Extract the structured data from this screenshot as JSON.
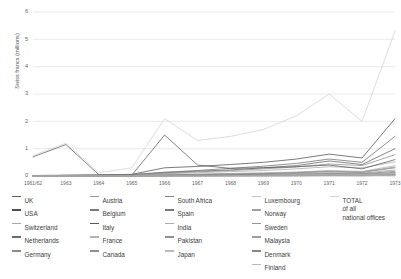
{
  "chart_data": {
    "type": "line",
    "title": "",
    "xlabel": "",
    "ylabel": "Swiss francs (millions)",
    "ylim": [
      0,
      6
    ],
    "yticks": [
      0,
      1,
      2,
      3,
      4,
      5,
      6
    ],
    "grid": true,
    "legend_position": "bottom",
    "categories": [
      "1961/62",
      "1963",
      "1964",
      "1965",
      "1966",
      "1967",
      "1968",
      "1969",
      "1970",
      "1971",
      "1972",
      "1973"
    ],
    "series": [
      {
        "name": "UK",
        "color": "#5d5d5d",
        "values": [
          0.7,
          1.15,
          0.05,
          0.05,
          0.12,
          0.18,
          0.22,
          0.3,
          0.38,
          0.55,
          0.42,
          1.0
        ]
      },
      {
        "name": "USA",
        "color": "#4f4f4f",
        "values": [
          0.02,
          0.03,
          0.04,
          0.06,
          0.3,
          0.35,
          0.42,
          0.5,
          0.62,
          0.8,
          0.66,
          2.1
        ]
      },
      {
        "name": "Switzerland",
        "color": "#a8a8a8",
        "values": [
          0.01,
          0.02,
          0.03,
          0.04,
          0.08,
          0.12,
          0.16,
          0.2,
          0.26,
          0.34,
          0.3,
          0.52
        ]
      },
      {
        "name": "Netherlands",
        "color": "#6b6b6b",
        "values": [
          0.01,
          0.02,
          0.03,
          0.05,
          0.14,
          0.2,
          0.28,
          0.36,
          0.46,
          0.62,
          0.5,
          1.45
        ]
      },
      {
        "name": "Germany",
        "color": "#8c8c8c",
        "values": [
          0.01,
          0.02,
          0.03,
          0.04,
          0.1,
          0.15,
          0.2,
          0.26,
          0.33,
          0.44,
          0.38,
          0.78
        ]
      },
      {
        "name": "Austria",
        "color": "#9a9a9a",
        "values": [
          0.0,
          0.01,
          0.01,
          0.02,
          0.03,
          0.04,
          0.05,
          0.07,
          0.09,
          0.12,
          0.1,
          0.22
        ]
      },
      {
        "name": "Belgium",
        "color": "#7a7a7a",
        "values": [
          0.0,
          0.01,
          0.01,
          0.02,
          0.04,
          0.05,
          0.07,
          0.09,
          0.12,
          0.16,
          0.13,
          0.3
        ]
      },
      {
        "name": "Italy",
        "color": "#585858",
        "values": [
          0.01,
          0.02,
          0.02,
          0.03,
          1.5,
          0.4,
          0.28,
          0.3,
          0.34,
          0.4,
          0.26,
          0.6
        ]
      },
      {
        "name": "France",
        "color": "#b4b4b4",
        "values": [
          0.0,
          0.01,
          0.01,
          0.02,
          0.05,
          0.07,
          0.09,
          0.12,
          0.15,
          0.2,
          0.17,
          0.38
        ]
      },
      {
        "name": "Canada",
        "color": "#8f8f8f",
        "values": [
          0.0,
          0.01,
          0.01,
          0.02,
          0.04,
          0.06,
          0.08,
          0.1,
          0.13,
          0.18,
          0.15,
          0.33
        ]
      },
      {
        "name": "South Africa",
        "color": "#838383",
        "values": [
          0.0,
          0.0,
          0.01,
          0.01,
          0.02,
          0.03,
          0.04,
          0.05,
          0.07,
          0.09,
          0.08,
          0.17
        ]
      },
      {
        "name": "Spain",
        "color": "#777777",
        "values": [
          0.0,
          0.0,
          0.01,
          0.01,
          0.02,
          0.02,
          0.03,
          0.04,
          0.05,
          0.07,
          0.06,
          0.13
        ]
      },
      {
        "name": "India",
        "color": "#aeaeae",
        "values": [
          0.0,
          0.0,
          0.01,
          0.01,
          0.01,
          0.02,
          0.02,
          0.03,
          0.04,
          0.05,
          0.05,
          0.1
        ]
      },
      {
        "name": "Pakistan",
        "color": "#909090",
        "values": [
          0.0,
          0.0,
          0.0,
          0.01,
          0.01,
          0.01,
          0.02,
          0.02,
          0.03,
          0.04,
          0.04,
          0.08
        ]
      },
      {
        "name": "Japan",
        "color": "#bcbcbc",
        "values": [
          0.0,
          0.0,
          0.0,
          0.01,
          0.01,
          0.01,
          0.02,
          0.02,
          0.03,
          0.04,
          0.03,
          0.07
        ]
      },
      {
        "name": "Luxembourg",
        "color": "#c2c2c2",
        "values": [
          0.0,
          0.0,
          0.0,
          0.0,
          0.01,
          0.01,
          0.01,
          0.02,
          0.02,
          0.03,
          0.03,
          0.06
        ]
      },
      {
        "name": "Norway",
        "color": "#a0a0a0",
        "values": [
          0.0,
          0.0,
          0.0,
          0.0,
          0.01,
          0.01,
          0.01,
          0.02,
          0.02,
          0.03,
          0.02,
          0.05
        ]
      },
      {
        "name": "Sweden",
        "color": "#949494",
        "values": [
          0.0,
          0.0,
          0.0,
          0.0,
          0.01,
          0.01,
          0.01,
          0.01,
          0.02,
          0.02,
          0.02,
          0.05
        ]
      },
      {
        "name": "Malaysia",
        "color": "#9e9e9e",
        "values": [
          0.0,
          0.0,
          0.0,
          0.0,
          0.0,
          0.01,
          0.01,
          0.01,
          0.01,
          0.02,
          0.02,
          0.04
        ]
      },
      {
        "name": "Denmark",
        "color": "#888888",
        "values": [
          0.0,
          0.0,
          0.0,
          0.0,
          0.0,
          0.01,
          0.01,
          0.01,
          0.01,
          0.02,
          0.01,
          0.03
        ]
      },
      {
        "name": "Finland",
        "color": "#b8b8b8",
        "values": [
          0.0,
          0.0,
          0.0,
          0.0,
          0.0,
          0.0,
          0.01,
          0.01,
          0.01,
          0.01,
          0.01,
          0.03
        ]
      },
      {
        "name": "TOTAL of all national offices",
        "color": "#d2d2d2",
        "values": [
          0.75,
          1.2,
          0.12,
          0.3,
          2.1,
          1.3,
          1.45,
          1.7,
          2.2,
          3.0,
          2.0,
          5.3
        ]
      }
    ]
  },
  "legend": {
    "columns": [
      {
        "items": [
          {
            "label": "UK",
            "color": "#5d5d5d"
          },
          {
            "label": "USA",
            "color": "#4f4f4f"
          },
          {
            "label": "Switzerland",
            "color": "#a8a8a8"
          },
          {
            "label": "Netherlands",
            "color": "#6b6b6b"
          },
          {
            "label": "Germany",
            "color": "#8c8c8c"
          }
        ]
      },
      {
        "items": [
          {
            "label": "Austria",
            "color": "#9a9a9a"
          },
          {
            "label": "Belgium",
            "color": "#7a7a7a"
          },
          {
            "label": "Italy",
            "color": "#585858"
          },
          {
            "label": "France",
            "color": "#b4b4b4"
          },
          {
            "label": "Canada",
            "color": "#8f8f8f"
          }
        ]
      },
      {
        "items": [
          {
            "label": "South Africa",
            "color": "#838383"
          },
          {
            "label": "Spain",
            "color": "#777777"
          },
          {
            "label": "India",
            "color": "#aeaeae"
          },
          {
            "label": "Pakistan",
            "color": "#909090"
          },
          {
            "label": "Japan",
            "color": "#bcbcbc"
          }
        ]
      },
      {
        "items": [
          {
            "label": "Luxembourg",
            "color": "#c2c2c2"
          },
          {
            "label": "Norway",
            "color": "#a0a0a0"
          },
          {
            "label": "Sweden",
            "color": "#949494"
          },
          {
            "label": "Malaysia",
            "color": "#9e9e9e"
          },
          {
            "label": "Denmark",
            "color": "#888888"
          },
          {
            "label": "Finland",
            "color": "#b8b8b8"
          }
        ]
      },
      {
        "items": [
          {
            "label": "TOTAL",
            "label2": "of all",
            "label3": "national offices",
            "color": "#d2d2d2"
          }
        ]
      }
    ]
  }
}
